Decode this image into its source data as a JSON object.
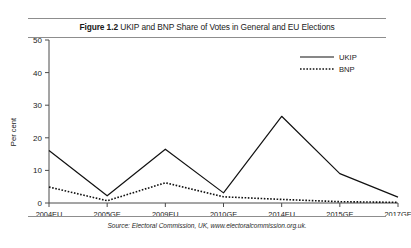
{
  "figure": {
    "number": "Figure 1.2",
    "title": "UKIP and BNP Share of Votes in General and EU Elections",
    "source": "Source: Electoral Commission, UK, www.electoralcommission.org.uk."
  },
  "chart_data": {
    "type": "line",
    "xlabel": "",
    "ylabel": "Per cent",
    "categories": [
      "2004EU",
      "2005GE",
      "2009EU",
      "2010GE",
      "2014EU",
      "2015GE",
      "2017GE"
    ],
    "series": [
      {
        "name": "UKIP",
        "style": "solid",
        "color": "#111111",
        "values": [
          16.1,
          2.2,
          16.5,
          3.1,
          26.6,
          9.0,
          1.8
        ]
      },
      {
        "name": "BNP",
        "style": "dotted",
        "color": "#111111",
        "values": [
          4.9,
          0.7,
          6.2,
          1.9,
          1.1,
          0.4,
          0.2
        ]
      }
    ],
    "ylim": [
      0,
      50
    ],
    "yticks": [
      0,
      10,
      20,
      30,
      40,
      50
    ],
    "ytick_labels": [
      "0",
      "10",
      "20",
      "30",
      "40",
      "50"
    ],
    "grid": false,
    "legend_position": "top-right",
    "legend_entries": [
      "UKIP",
      "BNP"
    ]
  },
  "colors": {
    "axis": "#4a4a4a",
    "line": "#111111",
    "rule": "#8d8d8d",
    "background": "#ffffff"
  }
}
